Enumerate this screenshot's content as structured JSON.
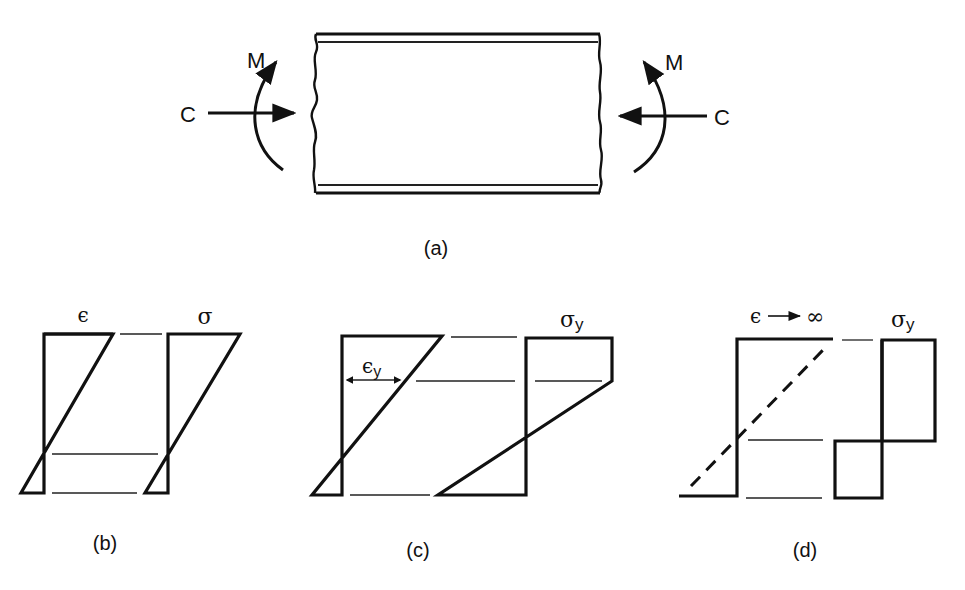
{
  "figure": {
    "panel_a": {
      "caption": "(a)",
      "left_moment_label": "M",
      "left_force_label": "C",
      "right_moment_label": "M",
      "right_force_label": "C"
    },
    "panel_b": {
      "caption": "(b)",
      "strain_label": "ϵ",
      "stress_label": "σ"
    },
    "panel_c": {
      "caption": "(c)",
      "yield_strain_label": "ϵ",
      "yield_strain_sub": "y",
      "yield_stress_label": "σ",
      "yield_stress_sub": "y"
    },
    "panel_d": {
      "caption": "(d)",
      "strain_label": "ϵ",
      "strain_limit": "∞",
      "yield_stress_label": "σ",
      "yield_stress_sub": "y"
    }
  }
}
